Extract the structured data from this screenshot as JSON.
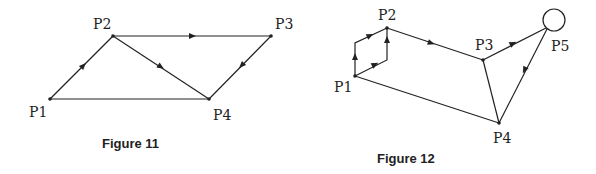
{
  "figures": [
    {
      "caption": "Figure 11",
      "nodes": [
        {
          "id": "P1",
          "label": "P1",
          "x": 50,
          "y": 99,
          "lx": 29,
          "ly": 116
        },
        {
          "id": "P2",
          "label": "P2",
          "x": 113,
          "y": 36,
          "lx": 94,
          "ly": 28
        },
        {
          "id": "P3",
          "label": "P3",
          "x": 271,
          "y": 36,
          "lx": 275,
          "ly": 28
        },
        {
          "id": "P4",
          "label": "P4",
          "x": 209,
          "y": 99,
          "lx": 213,
          "ly": 120
        }
      ],
      "edges": [
        {
          "from": "P1",
          "to": "P2",
          "directed": true
        },
        {
          "from": "P2",
          "to": "P3",
          "directed": true
        },
        {
          "from": "P2",
          "to": "P4",
          "directed": true
        },
        {
          "from": "P3",
          "to": "P4",
          "directed": true
        },
        {
          "from": "P1",
          "to": "P4",
          "directed": false
        }
      ]
    },
    {
      "caption": "Figure 12",
      "nodes": [
        {
          "id": "P1",
          "label": "P1",
          "x": 355,
          "y": 76,
          "lx": 334,
          "ly": 92
        },
        {
          "id": "P2",
          "label": "P2",
          "x": 387,
          "y": 28,
          "lx": 378,
          "ly": 20
        },
        {
          "id": "P3",
          "label": "P3",
          "x": 483,
          "y": 60,
          "lx": 475,
          "ly": 50
        },
        {
          "id": "P4",
          "label": "P4",
          "x": 499,
          "y": 123,
          "lx": 493,
          "ly": 143
        },
        {
          "id": "P5",
          "label": "P5",
          "x": 554,
          "y": 20,
          "lx": 551,
          "ly": 51,
          "shape": "circle",
          "r": 11
        }
      ],
      "edges": [
        {
          "from": "P1",
          "to": "P2",
          "via": [
            355,
            43
          ],
          "directed": true,
          "note": "upper parallel path"
        },
        {
          "from": "P1",
          "to": "P2",
          "via": [
            387,
            60
          ],
          "directed": true,
          "note": "lower parallel path"
        },
        {
          "from": "P2",
          "to": "P3",
          "directed": true
        },
        {
          "from": "P3",
          "to": "P5",
          "directed": true
        },
        {
          "from": "P5",
          "to": "P4",
          "directed": true
        },
        {
          "from": "P3",
          "to": "P4",
          "directed": false
        },
        {
          "from": "P1",
          "to": "P4",
          "directed": false
        }
      ]
    }
  ],
  "labels": {
    "fig11": {
      "P1": "P1",
      "P2": "P2",
      "P3": "P3",
      "P4": "P4",
      "caption": "Figure 11"
    },
    "fig12": {
      "P1": "P1",
      "P2": "P2",
      "P3": "P3",
      "P4": "P4",
      "P5": "P5",
      "caption": "Figure 12"
    }
  }
}
